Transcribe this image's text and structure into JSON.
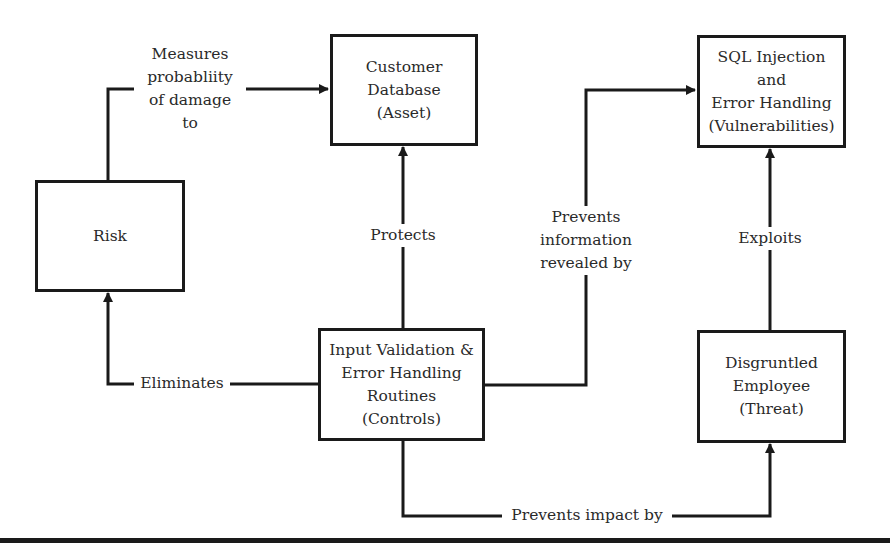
{
  "nodes": {
    "customer_database": {
      "label": "Customer\nDatabase\n(Asset)"
    },
    "vulnerabilities": {
      "label": "SQL Injection\nand\nError Handling\n(Vulnerabilities)"
    },
    "risk": {
      "label": "Risk"
    },
    "controls": {
      "label": "Input Validation &\nError Handling\nRoutines\n(Controls)"
    },
    "threat": {
      "label": "Disgruntled\nEmployee\n(Threat)"
    }
  },
  "edges": {
    "measures": {
      "label": "Measures\nprobabliity\nof damage\nto",
      "from": "risk",
      "to": "customer_database"
    },
    "protects": {
      "label": "Protects",
      "from": "controls",
      "to": "customer_database"
    },
    "prevents_information": {
      "label": "Prevents\ninformation\nrevealed by",
      "from": "controls",
      "to": "vulnerabilities"
    },
    "exploits": {
      "label": "Exploits",
      "from": "threat",
      "to": "vulnerabilities"
    },
    "eliminates": {
      "label": "Eliminates",
      "from": "controls",
      "to": "risk"
    },
    "prevents_impact": {
      "label": "Prevents impact by",
      "from": "controls",
      "to": "threat"
    }
  },
  "colors": {
    "line": "#1a1a1a",
    "text": "#2a2a2a",
    "background": "#ffffff"
  }
}
